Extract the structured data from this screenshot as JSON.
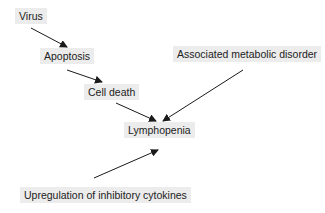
{
  "diagram": {
    "type": "flow",
    "nodes": [
      {
        "id": "virus",
        "label": "Virus",
        "x": 15,
        "y": 8
      },
      {
        "id": "apoptosis",
        "label": "Apoptosis",
        "x": 40,
        "y": 48
      },
      {
        "id": "cell_death",
        "label": "Cell death",
        "x": 84,
        "y": 84
      },
      {
        "id": "metabolic",
        "label": "Associated metabolic disorder",
        "x": 173,
        "y": 46
      },
      {
        "id": "lymphopenia",
        "label": "Lymphopenia",
        "x": 124,
        "y": 122
      },
      {
        "id": "cytokines",
        "label": "Upregulation of inhibitory cytokines",
        "x": 20,
        "y": 187
      }
    ],
    "edges": [
      {
        "from": "virus",
        "to": "apoptosis"
      },
      {
        "from": "apoptosis",
        "to": "cell_death"
      },
      {
        "from": "cell_death",
        "to": "lymphopenia"
      },
      {
        "from": "metabolic",
        "to": "lymphopenia"
      },
      {
        "from": "cytokines",
        "to": "lymphopenia"
      }
    ],
    "colors": {
      "node_bg": "#ececec",
      "arrow": "#1a1a1a",
      "text": "#222222"
    }
  }
}
